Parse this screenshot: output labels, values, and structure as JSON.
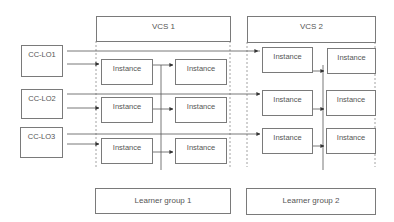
{
  "diagram": {
    "vcs": [
      {
        "label": "VCS 1"
      },
      {
        "label": "VCS 2"
      }
    ],
    "learning_outcomes": [
      {
        "label": "CC-LO1"
      },
      {
        "label": "CC-LO2"
      },
      {
        "label": "CC-LO3"
      }
    ],
    "instances": {
      "label": "Instance",
      "rows": [
        [
          "Instance",
          "Instance",
          "Instance",
          "Instance"
        ],
        [
          "Instance",
          "Instance",
          "Instance",
          "Instance"
        ],
        [
          "Instance",
          "Instance",
          "Instance",
          "Instance"
        ]
      ]
    },
    "learner_groups": [
      {
        "label": "Learner group 1"
      },
      {
        "label": "Learner group 2"
      }
    ],
    "colors": {
      "line": "#555555",
      "box_border": "#7a7a7a",
      "dashed": "#8a8a8a",
      "text": "#555555"
    }
  }
}
